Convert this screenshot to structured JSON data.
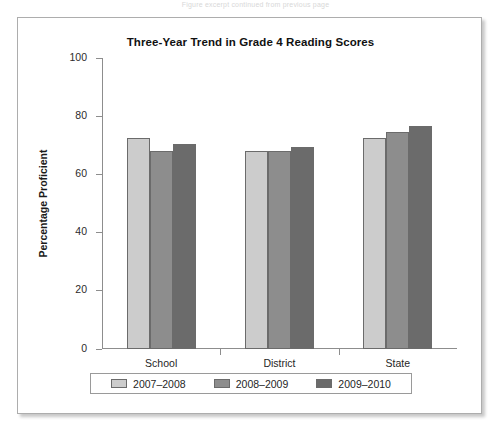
{
  "page": {
    "top_strip_text": "Figure excerpt continued from previous page"
  },
  "figure": {
    "title": "Three-Year Trend in Grade 4 Reading Scores"
  },
  "chart_data": {
    "type": "bar",
    "title": "Three-Year Trend in Grade 4 Reading Scores",
    "xlabel": "",
    "ylabel": "Percentage Proficient",
    "ylim": [
      0,
      100
    ],
    "yticks": [
      0,
      20,
      40,
      60,
      80,
      100
    ],
    "ytick_labels": [
      "0",
      "20",
      "40",
      "60",
      "80",
      "100"
    ],
    "grid": false,
    "legend_position": "bottom",
    "categories": [
      "School",
      "District",
      "State"
    ],
    "series": [
      {
        "name": "2007–2008",
        "color": "#cccccc",
        "values": [
          72.5,
          68,
          72.5
        ]
      },
      {
        "name": "2008–2009",
        "color": "#8d8d8d",
        "values": [
          68,
          68,
          74.5
        ]
      },
      {
        "name": "2009–2010",
        "color": "#6b6b6b",
        "values": [
          70.5,
          69.5,
          76.5
        ]
      }
    ]
  }
}
